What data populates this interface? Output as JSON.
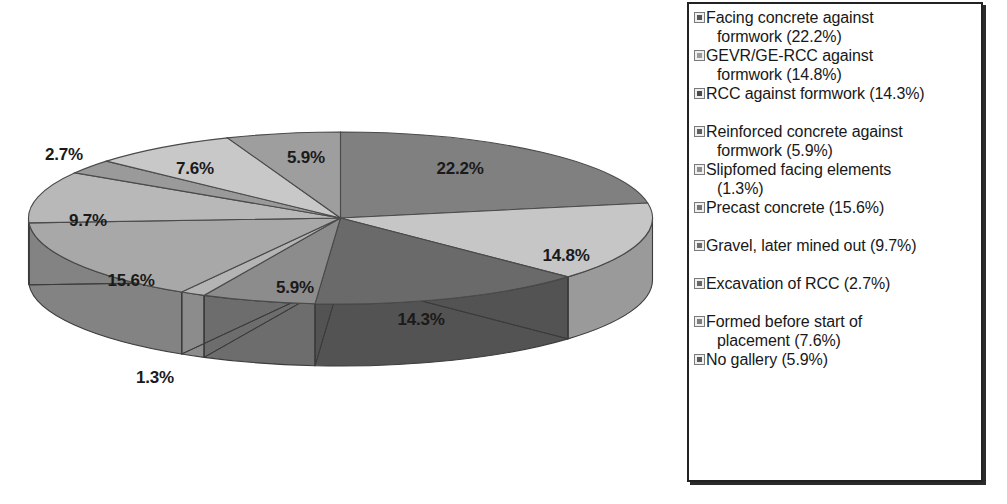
{
  "chart_data": {
    "type": "pie",
    "title": "",
    "subtitle": "",
    "xlabel": "",
    "ylabel": "",
    "legend_position": "right",
    "grid": false,
    "three_d": true,
    "start_angle_deg": 0,
    "direction": "clockwise",
    "unit": "%",
    "categories": [
      "Facing concrete against formwork",
      "GEVR/GE-RCC against formwork",
      "RCC against formwork",
      "Reinforced concrete against formwork",
      "Slipfomed facing elements",
      "Precast concrete",
      "Gravel, later mined out",
      "Excavation of RCC",
      "Formed before start of placement",
      "No gallery"
    ],
    "values": [
      22.2,
      14.8,
      14.3,
      5.9,
      1.3,
      15.6,
      9.7,
      2.7,
      7.6,
      5.9
    ],
    "value_labels": [
      "22.2%",
      "14.8%",
      "14.3%",
      "5.9%",
      "1.3%",
      "15.6%",
      "9.7%",
      "2.7%",
      "7.6%",
      "5.9%"
    ],
    "colors": [
      "#808080",
      "#c6c6c6",
      "#6a6a6a",
      "#8c8c8c",
      "#b4b4b4",
      "#a8a8a8",
      "#b8b8b8",
      "#9a9a9a",
      "#c8c8c8",
      "#9e9e9e"
    ]
  },
  "slice_labels": [
    {
      "text": "22.2%",
      "x": 460,
      "y": 169
    },
    {
      "text": "14.8%",
      "x": 566,
      "y": 256
    },
    {
      "text": "14.3%",
      "x": 421,
      "y": 320
    },
    {
      "text": "5.9%",
      "x": 295,
      "y": 288
    },
    {
      "text": "1.3%",
      "x": 155,
      "y": 378
    },
    {
      "text": "15.6%",
      "x": 131,
      "y": 281
    },
    {
      "text": "9.7%",
      "x": 88,
      "y": 221
    },
    {
      "text": "2.7%",
      "x": 64,
      "y": 155
    },
    {
      "text": "7.6%",
      "x": 195,
      "y": 169
    },
    {
      "text": "5.9%",
      "x": 306,
      "y": 158
    }
  ],
  "legend": {
    "items": [
      {
        "label": "Facing concrete against",
        "label_cont": "formwork (22.2%)",
        "swatch": "#555555",
        "gap_before": false
      },
      {
        "label": "GEVR/GE-RCC against",
        "label_cont": "formwork (14.8%)",
        "swatch": "#9b9b9b",
        "gap_before": false
      },
      {
        "label": "RCC against formwork (14.3%)",
        "label_cont": "",
        "swatch": "#4a4a4a",
        "gap_before": false
      },
      {
        "label": "Reinforced concrete against",
        "label_cont": "formwork (5.9%)",
        "swatch": "#5f5f5f",
        "gap_before": true
      },
      {
        "label": "Slipfomed facing elements",
        "label_cont": "(1.3%)",
        "swatch": "#8d8d8d",
        "gap_before": false
      },
      {
        "label": "Precast concrete (15.6%)",
        "label_cont": "",
        "swatch": "#757575",
        "gap_before": false
      },
      {
        "label": "Gravel, later mined out (9.7%)",
        "label_cont": "",
        "swatch": "#6b6b6b",
        "gap_before": true
      },
      {
        "label": "Excavation of RCC (2.7%)",
        "label_cont": "",
        "swatch": "#666666",
        "gap_before": true
      },
      {
        "label": "Formed before start of",
        "label_cont": "placement (7.6%)",
        "swatch": "#7e7e7e",
        "gap_before": true
      },
      {
        "label": "No gallery (5.9%)",
        "label_cont": "",
        "swatch": "#5a5a5a",
        "gap_before": false
      }
    ]
  }
}
